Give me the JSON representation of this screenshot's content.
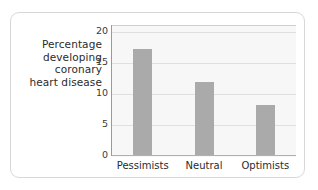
{
  "chart_data": {
    "type": "bar",
    "title": "",
    "subtitle": "",
    "xlabel": "",
    "ylabel": "Percentage developing coronary heart disease",
    "ylabel_lines": [
      "Percentage",
      "developing",
      "coronary",
      "heart disease"
    ],
    "categories": [
      "Pessimists",
      "Neutral",
      "Optimists"
    ],
    "values": [
      17.2,
      11.8,
      8.0
    ],
    "yticks": [
      0,
      5,
      10,
      15,
      20
    ],
    "ytick_labels": [
      "0",
      "5",
      "10",
      "15",
      "20"
    ],
    "ylim": [
      0,
      21
    ],
    "grid": "horizontal",
    "legend": "none",
    "bar_color": "#aaaaaa",
    "plot_background": "#f7f7f7",
    "gridline_color": "#e0e0e0",
    "axis_color": "#9a9a9a",
    "card_border_color": "#d8d8d8",
    "page_background": "#ffffff"
  }
}
